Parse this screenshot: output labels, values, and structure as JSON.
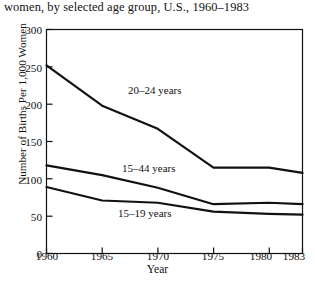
{
  "caption": "women, by selected age group, U.S., 1960–1983",
  "axes": {
    "xlabel": "Year",
    "ylabel": "Number of Births Per 1,000 Women",
    "yticks": [
      "0",
      "50",
      "100",
      "150",
      "200",
      "250",
      "300"
    ],
    "xticks": [
      "1960",
      "1965",
      "1970",
      "1975",
      "1980",
      "1983"
    ]
  },
  "annotations": [
    {
      "text": "20–24 years",
      "x": 128,
      "y": 84
    },
    {
      "text": "15–44 years",
      "x": 122,
      "y": 162
    },
    {
      "text": "15–19 years",
      "x": 118,
      "y": 207
    }
  ],
  "chart_data": {
    "type": "line",
    "title": "women, by selected age group, U.S., 1960–1983",
    "xlabel": "Year",
    "ylabel": "Number of Births Per 1,000 Women",
    "x": [
      1960,
      1965,
      1970,
      1975,
      1980,
      1983
    ],
    "xlim": [
      1960,
      1983
    ],
    "ylim": [
      0,
      300
    ],
    "ytick_values": [
      0,
      50,
      100,
      150,
      200,
      250,
      300
    ],
    "xtick_values": [
      1960,
      1965,
      1970,
      1975,
      1980,
      1983
    ],
    "grid": false,
    "legend": "inline-annotations",
    "line_color": "#111111",
    "series": [
      {
        "name": "20–24 years",
        "values": [
          252,
          198,
          167,
          115,
          115,
          108
        ]
      },
      {
        "name": "15–44 years",
        "values": [
          118,
          105,
          88,
          66,
          68,
          66
        ]
      },
      {
        "name": "15–19 years",
        "values": [
          89,
          71,
          68,
          56,
          53,
          52
        ]
      }
    ]
  }
}
